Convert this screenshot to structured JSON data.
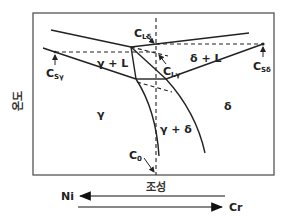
{
  "diagram": {
    "type": "phase-diagram",
    "y_axis_label": "온도",
    "x_axis_label": "조성",
    "phases": {
      "gamma_L": "γ + L",
      "delta_L": "δ + L",
      "gamma": "γ",
      "delta": "δ",
      "gamma_delta": "γ + δ"
    },
    "compositions": {
      "c_l_delta": {
        "main": "C",
        "sub": "Lδ"
      },
      "c_l_gamma": {
        "main": "C",
        "sub": "Lγ"
      },
      "c_s_gamma": {
        "main": "C",
        "sub": "Sγ"
      },
      "c_s_delta": {
        "main": "C",
        "sub": "Sδ"
      },
      "c_0": {
        "main": "C",
        "sub": "0"
      }
    },
    "arrows": {
      "left_element": "Ni",
      "right_element": "Cr"
    },
    "colors": {
      "line": "#222222",
      "frame": "#555555"
    }
  }
}
